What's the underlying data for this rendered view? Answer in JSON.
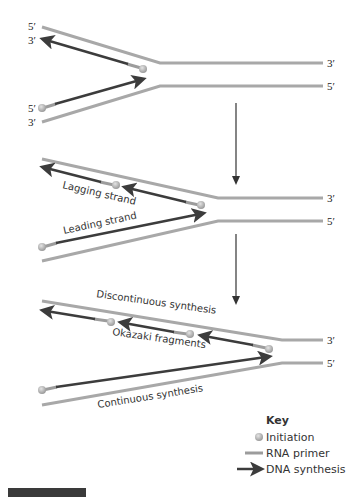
{
  "colors": {
    "template_strand": "#a8a8a8",
    "template_strand_edge": "#8e8e8e",
    "rna_primer": "#9c9c9c",
    "dna_synthesis": "#3c3c3c",
    "initiation_dot": "#b5b5b5",
    "arrow_down": "#333333",
    "footer_bar": "#3a3a3a"
  },
  "panels": [
    {
      "id": "panel-1",
      "end_labels": {
        "top_left_5": "5′",
        "top_left_3": "3′",
        "bottom_left_5": "5′",
        "bottom_left_3": "3′",
        "right_top": "3′",
        "right_bottom": "5′"
      }
    },
    {
      "id": "panel-2",
      "end_labels": {
        "right_top": "3′",
        "right_bottom": "5′"
      },
      "annotations": {
        "lagging": "Lagging strand",
        "leading": "Leading strand"
      }
    },
    {
      "id": "panel-3",
      "end_labels": {
        "right_top": "3′",
        "right_bottom": "5′"
      },
      "annotations": {
        "discontinuous": "Discontinuous synthesis",
        "okazaki": "Okazaki fragments",
        "continuous": "Continuous synthesis"
      }
    }
  ],
  "key": {
    "title": "Key",
    "items": [
      {
        "icon": "initiation-dot-icon",
        "label": "Initiation"
      },
      {
        "icon": "rna-primer-icon",
        "label": "RNA primer"
      },
      {
        "icon": "dna-synthesis-arrow-icon",
        "label": "DNA synthesis"
      }
    ]
  }
}
